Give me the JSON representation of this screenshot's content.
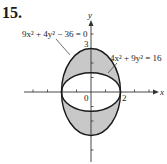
{
  "problem_number": "15.",
  "axes": {
    "x_label": "x",
    "y_label": "y",
    "origin_label": "0",
    "x_tick_label": "2",
    "y_tick_label": "3"
  },
  "curves": [
    {
      "id": "tall-ellipse",
      "equation": "9x² + 4y² − 36 = 0",
      "semi_x": 2,
      "semi_y": 3
    },
    {
      "id": "wide-ellipse",
      "equation": "4x² + 9y² = 16",
      "semi_x": 2,
      "semi_y": 1.3333
    }
  ],
  "colors": {
    "shaded_region": "#c8c8c8",
    "curve": "#1a1a1a",
    "axis": "#333333"
  }
}
